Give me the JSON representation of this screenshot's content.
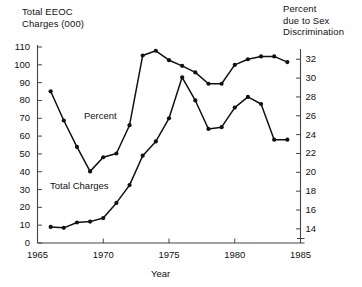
{
  "chart_data": {
    "type": "line",
    "title": "",
    "xlabel": "Year",
    "ylabel_left": "Total EEOC\nCharges (000)",
    "ylabel_right": "Percent\ndue to Sex\nDiscrimination",
    "x": [
      1966,
      1967,
      1968,
      1969,
      1970,
      1971,
      1972,
      1973,
      1974,
      1975,
      1976,
      1977,
      1978,
      1979,
      1980,
      1981,
      1982,
      1983,
      1984
    ],
    "xlim": [
      1965,
      1985
    ],
    "xticks": [
      1965,
      1970,
      1975,
      1980,
      1985
    ],
    "xticklabels": [
      "1965",
      "1970",
      "1975",
      "1980",
      "1985"
    ],
    "ylim_left": [
      0,
      110
    ],
    "yticks_left": [
      0,
      10,
      20,
      30,
      40,
      50,
      60,
      70,
      80,
      90,
      100,
      110
    ],
    "yticklabels_left": [
      "0",
      "10",
      "20",
      "30",
      "40",
      "50",
      "60",
      "70",
      "80",
      "90",
      "100",
      "110"
    ],
    "ylim_right": [
      12.5,
      33.3
    ],
    "yticks_right": [
      14,
      16,
      18,
      20,
      22,
      24,
      26,
      28,
      30,
      32
    ],
    "yticklabels_right": [
      "14",
      "16",
      "18",
      "20",
      "22",
      "24",
      "26",
      "28",
      "30",
      "32"
    ],
    "grid": false,
    "legend": "inline-labels",
    "series": [
      {
        "name": "Percent",
        "axis": "right",
        "label_text": "Percent",
        "values": [
          28.6,
          25.5,
          22.7,
          20.1,
          21.6,
          22.0,
          25.0,
          32.4,
          32.9,
          31.9,
          31.3,
          30.6,
          29.4,
          29.4,
          31.4,
          32.0,
          32.3,
          32.3,
          31.7
        ]
      },
      {
        "name": "Total Charges",
        "axis": "left",
        "label_text": "Total Charges",
        "values": [
          9,
          8.5,
          11.5,
          12,
          14,
          22.5,
          32.5,
          49,
          57,
          70,
          93,
          80,
          64,
          65,
          76,
          82,
          78,
          58,
          58
        ]
      }
    ]
  },
  "labels": {
    "left_axis_title": "Total EEOC\nCharges (000)",
    "right_axis_title": "Percent\ndue to Sex\nDiscrimination",
    "x_axis_title": "Year",
    "series_percent": "Percent",
    "series_total_charges": "Total Charges"
  },
  "colors": {
    "line": "#111111",
    "marker": "#111111",
    "axis": "#444444",
    "background": "#ffffff"
  }
}
